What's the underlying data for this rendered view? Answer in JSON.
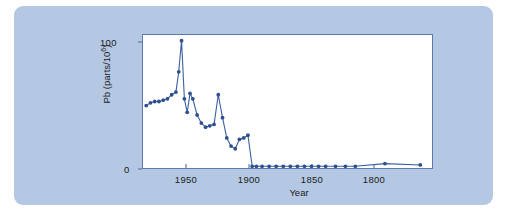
{
  "figure": {
    "background_color": "#b4c8e4",
    "plot_background_color": "#ffffff",
    "line_color": "#3b5fa0",
    "marker_color": "#2f4f8f",
    "axis_color": "#5b7bb0"
  },
  "axis": {
    "y_label_prefix": "Pb (parts/10",
    "y_label_exponent": "6",
    "y_label_suffix": ")",
    "x_label": "Year",
    "y_ticks": [
      "100",
      "0"
    ],
    "x_ticks": [
      "1950",
      "1900",
      "1850",
      "1800"
    ]
  },
  "chart_data": {
    "type": "line",
    "title": "",
    "subtitle": "",
    "xlabel": "Year",
    "ylabel": "Pb (parts/10^6)",
    "xlim": [
      1978,
      1772
    ],
    "ylim": [
      0,
      100
    ],
    "x_axis_reversed": true,
    "grid": false,
    "legend": null,
    "markers": "filled-circle",
    "x_tick_values": [
      1950,
      1900,
      1850,
      1800
    ],
    "y_tick_values": [
      0,
      100
    ],
    "series": [
      {
        "name": "Lead concentration",
        "x": [
          1975,
          1972,
          1969,
          1966,
          1963,
          1960,
          1957,
          1954,
          1952,
          1950,
          1948,
          1946,
          1944,
          1942,
          1939,
          1936,
          1933,
          1930,
          1927,
          1924,
          1921,
          1918,
          1915,
          1912,
          1909,
          1906,
          1903,
          1900,
          1897,
          1893,
          1888,
          1883,
          1878,
          1873,
          1868,
          1863,
          1858,
          1853,
          1848,
          1841,
          1834,
          1827,
          1806,
          1781
        ],
        "y": [
          47,
          49,
          50,
          50,
          51,
          52,
          55,
          57,
          72,
          95,
          52,
          42,
          56,
          52,
          40,
          34,
          31,
          32,
          33,
          55,
          38,
          23,
          17,
          15,
          22,
          23,
          25,
          2,
          2,
          2,
          2,
          2,
          2,
          2,
          2,
          2,
          2,
          2,
          2,
          2,
          2,
          2,
          4,
          3
        ]
      }
    ]
  }
}
